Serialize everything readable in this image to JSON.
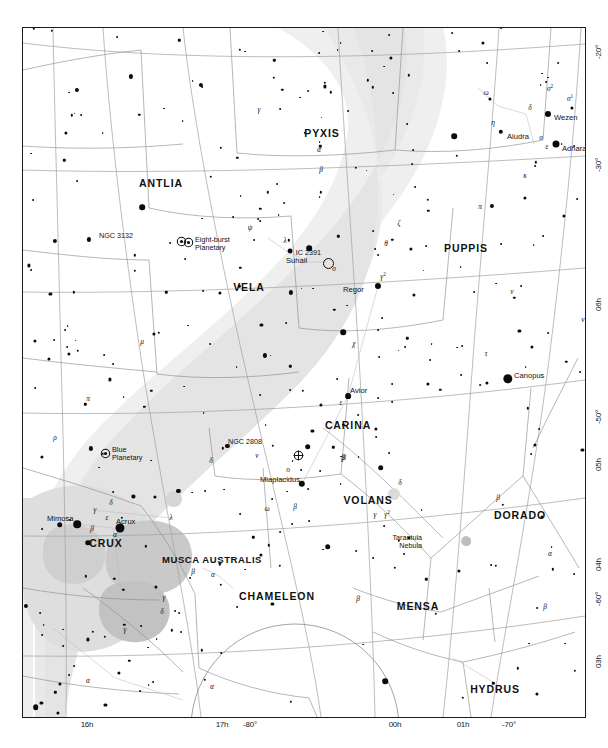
{
  "chart_title": "",
  "chart_data": {
    "type": "scatter",
    "projection": "conic / polar southern",
    "xlabel": "Right Ascension",
    "ylabel": "Declination",
    "grid": true,
    "legend": null,
    "ra_ticks": [
      "06h",
      "05h",
      "04h",
      "03h",
      "01h",
      "00h",
      "17h",
      "16h"
    ],
    "dec_ticks": [
      "-20°",
      "-30°",
      "-50°",
      "-60°",
      "-70°",
      "-80°"
    ],
    "axis_bottom": [
      {
        "label": "16h",
        "x": 65
      },
      {
        "label": "17h",
        "x": 200
      },
      {
        "label": "-80°",
        "x": 228
      },
      {
        "label": "00h",
        "x": 373
      },
      {
        "label": "01h",
        "x": 441
      },
      {
        "label": "-70°",
        "x": 487
      }
    ],
    "axis_right": [
      {
        "label": "-20°",
        "y": 16
      },
      {
        "label": "-30°",
        "y": 129
      },
      {
        "label": "06h",
        "y": 268
      },
      {
        "label": "-50°",
        "y": 381
      },
      {
        "label": "05h",
        "y": 428
      },
      {
        "label": "04h",
        "y": 528
      },
      {
        "label": "-60°",
        "y": 563
      },
      {
        "label": "03h",
        "y": 625
      }
    ],
    "constellations": [
      {
        "name": "PYXIS",
        "x": 299,
        "y": 105
      },
      {
        "name": "ANTLIA",
        "x": 138,
        "y": 155
      },
      {
        "name": "VELA",
        "x": 226,
        "y": 259
      },
      {
        "name": "PUPPIS",
        "x": 443,
        "y": 220
      },
      {
        "name": "CARINA",
        "x": 325,
        "y": 397
      },
      {
        "name": "VOLANS",
        "x": 345,
        "y": 472
      },
      {
        "name": "DORADO",
        "x": 497,
        "y": 487
      },
      {
        "name": "CRUX",
        "x": 83,
        "y": 515
      },
      {
        "name": "MUSCA AUSTRALIS",
        "x": 189,
        "y": 531
      },
      {
        "name": "CHAMELEON",
        "x": 254,
        "y": 568
      },
      {
        "name": "MENSA",
        "x": 395,
        "y": 578
      },
      {
        "name": "HYDRUS",
        "x": 472,
        "y": 661
      },
      {
        "name": "APUS",
        "x": 177,
        "y": 699
      },
      {
        "name": "OCTANS",
        "x": 295,
        "y": 700
      }
    ],
    "named_stars": [
      {
        "name": "Wezen",
        "x": 525,
        "y": 86,
        "mag": 1.8,
        "label_dx": 6,
        "label_dy": 3
      },
      {
        "name": "Aludra",
        "x": 478,
        "y": 104,
        "mag": 2.4,
        "label_dx": 6,
        "label_dy": 4
      },
      {
        "name": "Adhara",
        "x": 533,
        "y": 116,
        "mag": 1.5,
        "label_dx": 6,
        "label_dy": 4
      },
      {
        "name": "Suhail",
        "x": 267,
        "y": 223,
        "mag": 2.2,
        "label_dx": -4,
        "label_dy": 9
      },
      {
        "name": "Regor",
        "x": 355,
        "y": 258,
        "mag": 1.8,
        "label_dx": -35,
        "label_dy": 3
      },
      {
        "name": "Canopus",
        "x": 485,
        "y": 351,
        "mag": 0.7,
        "label_dx": 6,
        "label_dy": -4
      },
      {
        "name": "Avior",
        "x": 325,
        "y": 368,
        "mag": 1.9,
        "label_dx": 2,
        "label_dy": -6
      },
      {
        "name": "Miaplacidus",
        "x": 279,
        "y": 456,
        "mag": 1.7,
        "label_dx": -42,
        "label_dy": -5
      },
      {
        "name": "Mimosa",
        "x": 54,
        "y": 496,
        "mag": 1.3,
        "label_dx": -30,
        "label_dy": -6
      },
      {
        "name": "Acrux",
        "x": 97,
        "y": 500,
        "mag": 0.8,
        "label_dx": -4,
        "label_dy": -7
      }
    ],
    "deep_sky_objects": [
      {
        "name": "NGC 3132",
        "type": "planetary",
        "x": 158,
        "y": 210,
        "label_dx": -48,
        "label_dy": -2
      },
      {
        "name": "Eight-burst\nPlanetary",
        "type": "planetary-name",
        "x": 165,
        "y": 211,
        "label_dx": 7,
        "label_dy": 1
      },
      {
        "name": "IC 2391",
        "type": "open-cluster",
        "x": 304,
        "y": 234,
        "label_dx": -6,
        "label_dy": -9
      },
      {
        "name": "NGC 2808",
        "type": "globular",
        "x": 275,
        "y": 424,
        "label_dx": -36,
        "label_dy": -10
      },
      {
        "name": "Blue\nPlanetary",
        "type": "planetary",
        "x": 82,
        "y": 422,
        "label_dx": 7,
        "label_dy": 0
      },
      {
        "name": "Tarantula\nNebula",
        "type": "nebula",
        "x": 443,
        "y": 513,
        "label_dx": -44,
        "label_dy": -3
      }
    ],
    "bayer_labels": [
      {
        "g": "α",
        "x": 296,
        "y": 121
      },
      {
        "g": "β",
        "x": 298,
        "y": 141
      },
      {
        "g": "γ",
        "x": 236,
        "y": 81
      },
      {
        "g": "ψ",
        "x": 227,
        "y": 199
      },
      {
        "g": "λ",
        "x": 262,
        "y": 212
      },
      {
        "g": "σ",
        "x": 311,
        "y": 240
      },
      {
        "g": "ζ",
        "x": 376,
        "y": 195
      },
      {
        "g": "π",
        "x": 457,
        "y": 178
      },
      {
        "g": "ν",
        "x": 489,
        "y": 263
      },
      {
        "g": "τ",
        "x": 463,
        "y": 325
      },
      {
        "g": "χ",
        "x": 331,
        "y": 315
      },
      {
        "g": "ε",
        "x": 318,
        "y": 374
      },
      {
        "g": "θ",
        "x": 363,
        "y": 215
      },
      {
        "g": "μ",
        "x": 119,
        "y": 313
      },
      {
        "g": "π",
        "x": 65,
        "y": 370
      },
      {
        "g": "ρ",
        "x": 32,
        "y": 409
      },
      {
        "g": "δ",
        "x": 188,
        "y": 432
      },
      {
        "g": "β",
        "x": 320,
        "y": 429
      },
      {
        "g": "ο",
        "x": 265,
        "y": 441
      },
      {
        "g": "ν",
        "x": 234,
        "y": 427
      },
      {
        "g": "β",
        "x": 272,
        "y": 478
      },
      {
        "g": "ω",
        "x": 244,
        "y": 480
      },
      {
        "g": "γ",
        "x": 72,
        "y": 481
      },
      {
        "g": "δ",
        "x": 88,
        "y": 474
      },
      {
        "g": "ε",
        "x": 84,
        "y": 489
      },
      {
        "g": "λ",
        "x": 148,
        "y": 489
      },
      {
        "g": "β",
        "x": 69,
        "y": 500
      },
      {
        "g": "α",
        "x": 92,
        "y": 506
      },
      {
        "g": "β",
        "x": 170,
        "y": 543
      },
      {
        "g": "α",
        "x": 190,
        "y": 546
      },
      {
        "g": "γ",
        "x": 141,
        "y": 569
      },
      {
        "g": "δ",
        "x": 139,
        "y": 583
      },
      {
        "g": "γ",
        "x": 352,
        "y": 486
      },
      {
        "g": "δ",
        "x": 377,
        "y": 454
      },
      {
        "g": "β",
        "x": 321,
        "y": 429
      },
      {
        "g": "β",
        "x": 475,
        "y": 469
      },
      {
        "g": "α",
        "x": 527,
        "y": 525
      },
      {
        "g": "β",
        "x": 522,
        "y": 578
      },
      {
        "g": "α",
        "x": 65,
        "y": 652
      },
      {
        "g": "α",
        "x": 189,
        "y": 658
      },
      {
        "g": "γ",
        "x": 212,
        "y": 707
      },
      {
        "g": "γ",
        "x": 102,
        "y": 601
      },
      {
        "g": "ω",
        "x": 463,
        "y": 64
      },
      {
        "g": "δ",
        "x": 507,
        "y": 79
      },
      {
        "g": "η",
        "x": 470,
        "y": 94
      },
      {
        "g": "σ",
        "x": 518,
        "y": 109
      },
      {
        "g": "ε",
        "x": 524,
        "y": 118
      },
      {
        "g": "κ",
        "x": 502,
        "y": 147
      },
      {
        "g": "δ",
        "x": 570,
        "y": 178
      },
      {
        "g": "ν",
        "x": 560,
        "y": 291
      },
      {
        "g": "δ",
        "x": 575,
        "y": 144
      },
      {
        "g": "β",
        "x": 335,
        "y": 570
      }
    ],
    "bayer_superscripts": [
      {
        "g": "σ",
        "sup": "2",
        "x": 527,
        "y": 60
      },
      {
        "g": "σ",
        "sup": "1",
        "x": 547,
        "y": 70
      },
      {
        "g": "γ",
        "sup": "2",
        "x": 360,
        "y": 248
      },
      {
        "g": "γ",
        "sup": "2",
        "x": 364,
        "y": 486
      }
    ]
  },
  "colors": {
    "frame": "#1a1a1a",
    "star": "#0b0b0b",
    "gridline": "#9a9a9a",
    "boundary": "#8c8c8c",
    "milkyway": "#ededed",
    "milkyway_dense": "#e2e2e2",
    "nebula": "#bdbdbd",
    "text": "#111111",
    "background": "#ffffff"
  }
}
